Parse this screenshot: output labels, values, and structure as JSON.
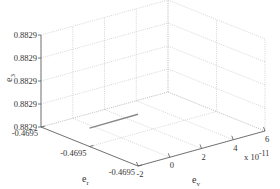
{
  "chart_data": {
    "type": "line",
    "projection": "3d",
    "title": "",
    "axes": {
      "x": {
        "label_main": "e",
        "label_sub": "v",
        "ticks": [
          -2,
          0,
          2,
          4,
          6
        ],
        "tick_labels": [
          "-2",
          "0",
          "2",
          "4",
          "6"
        ],
        "range": [
          -2,
          6
        ],
        "multiplier": "x 10",
        "multiplier_exp": "-11"
      },
      "y": {
        "label_main": "e",
        "label_sub": "r",
        "ticks": [
          0,
          1,
          2
        ],
        "tick_labels": [
          "-0.4695",
          "-0.4695",
          "-0.4695"
        ],
        "range": [
          0,
          2
        ]
      },
      "z": {
        "label_main": "e",
        "label_sub": "3",
        "ticks": [
          0,
          1,
          2,
          3,
          4
        ],
        "tick_labels": [
          "0.8829",
          "0.8829",
          "0.8829",
          "0.8829",
          "0.8829"
        ],
        "range": [
          0,
          4
        ]
      }
    },
    "grid": true,
    "series": [
      {
        "name": "trajectory",
        "color": "#888888",
        "points": [
          {
            "x": -2,
            "y": 1.0,
            "z": 0.8
          },
          {
            "x": -2,
            "y": 0.0,
            "z": 2.25
          }
        ]
      }
    ]
  },
  "colors": {
    "grid": "#bbbbbb",
    "axis": "#555555",
    "line": "#888888"
  }
}
